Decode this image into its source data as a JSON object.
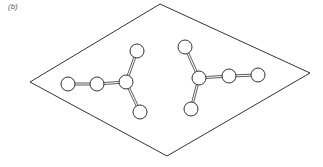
{
  "figure": {
    "label": "(b)",
    "line_color": "#333333",
    "plane": {
      "points": [
        [
          160,
          4
        ],
        [
          310,
          73
        ],
        [
          167,
          156
        ],
        [
          30,
          82
        ]
      ]
    },
    "molecules": [
      {
        "name": "left-molecule",
        "atoms": [
          {
            "x": 68,
            "y": 84
          },
          {
            "x": 97,
            "y": 84
          },
          {
            "x": 126,
            "y": 82
          },
          {
            "x": 137,
            "y": 51
          },
          {
            "x": 140,
            "y": 112
          }
        ],
        "bonds": [
          [
            0,
            1
          ],
          [
            1,
            2
          ],
          [
            2,
            3
          ],
          [
            2,
            4
          ]
        ]
      },
      {
        "name": "right-molecule",
        "atoms": [
          {
            "x": 185,
            "y": 47
          },
          {
            "x": 199,
            "y": 78
          },
          {
            "x": 191,
            "y": 109
          },
          {
            "x": 229,
            "y": 76
          },
          {
            "x": 258,
            "y": 75
          }
        ],
        "bonds": [
          [
            0,
            1
          ],
          [
            1,
            2
          ],
          [
            1,
            3
          ],
          [
            3,
            4
          ]
        ]
      }
    ],
    "atom_radius": 7
  }
}
